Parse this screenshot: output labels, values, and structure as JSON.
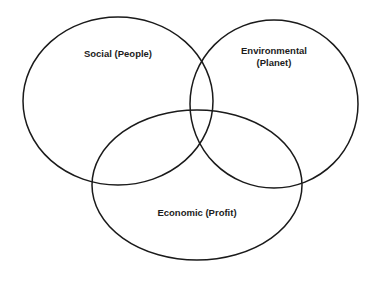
{
  "diagram": {
    "type": "venn",
    "title": "",
    "background_color": "#ffffff",
    "stroke_color": "#1a1a1a",
    "label_color": "#1c1c1c",
    "top_artifact_text": "....",
    "sets": [
      {
        "id": "social",
        "label": "Social (People)",
        "position": "top-left",
        "center_x": 118,
        "center_y": 101,
        "radius_x": 95,
        "radius_y": 84
      },
      {
        "id": "environmental",
        "label": "Environmental\n(Planet)",
        "label_line1": "Environmental",
        "label_line2": "(Planet)",
        "position": "top-right",
        "center_x": 274,
        "center_y": 104,
        "radius_x": 84,
        "radius_y": 84
      },
      {
        "id": "economic",
        "label": "Economic (Profit)",
        "position": "bottom-center",
        "center_x": 197,
        "center_y": 185,
        "radius_x": 105,
        "radius_y": 75
      }
    ]
  }
}
